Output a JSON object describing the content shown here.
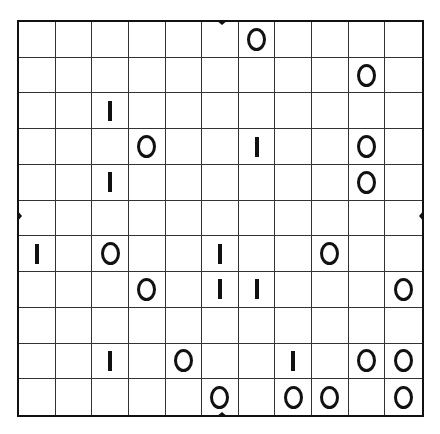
{
  "puzzle": {
    "type": "binary-grid",
    "rows": 11,
    "cols": 11,
    "symbols": [
      "O",
      "I"
    ],
    "grid": [
      [
        "",
        "",
        "",
        "",
        "",
        "",
        "O",
        "",
        "",
        "",
        ""
      ],
      [
        "",
        "",
        "",
        "",
        "",
        "",
        "",
        "",
        "",
        "O",
        ""
      ],
      [
        "",
        "",
        "I",
        "",
        "",
        "",
        "",
        "",
        "",
        "",
        ""
      ],
      [
        "",
        "",
        "",
        "O",
        "",
        "",
        "I",
        "",
        "",
        "O",
        ""
      ],
      [
        "",
        "",
        "I",
        "",
        "",
        "",
        "",
        "",
        "",
        "O",
        ""
      ],
      [
        "",
        "",
        "",
        "",
        "",
        "",
        "",
        "",
        "",
        "",
        ""
      ],
      [
        "I",
        "",
        "O",
        "",
        "",
        "I",
        "",
        "",
        "O",
        "",
        ""
      ],
      [
        "",
        "",
        "",
        "O",
        "",
        "I",
        "I",
        "",
        "",
        "",
        "O"
      ],
      [
        "",
        "",
        "",
        "",
        "",
        "",
        "",
        "",
        "",
        "",
        ""
      ],
      [
        "",
        "",
        "I",
        "",
        "O",
        "",
        "",
        "I",
        "",
        "O",
        "O"
      ],
      [
        "",
        "",
        "",
        "",
        "",
        "O",
        "",
        "O",
        "O",
        "",
        "O"
      ]
    ],
    "markers": [
      "top",
      "bottom",
      "left",
      "right"
    ]
  },
  "colors": {
    "line": "#333333",
    "border": "#111111",
    "glyph": "#111111",
    "background": "#ffffff"
  }
}
